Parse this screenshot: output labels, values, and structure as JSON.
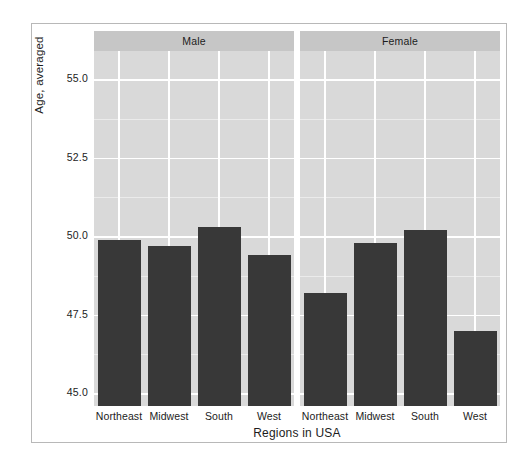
{
  "chart_data": {
    "type": "bar",
    "title": "",
    "xlabel": "Regions in USA",
    "ylabel": "Age, averaged",
    "categories": [
      "Northeast",
      "Midwest",
      "South",
      "West"
    ],
    "facet_variable": "Gender",
    "facets": [
      {
        "label": "Male",
        "values": [
          49.9,
          49.7,
          50.3,
          49.4
        ]
      },
      {
        "label": "Female",
        "values": [
          48.2,
          49.8,
          50.2,
          47.0
        ]
      }
    ],
    "ylim": [
      44.6,
      55.9
    ],
    "yticks": [
      "45.0",
      "47.5",
      "50.0",
      "52.5",
      "55.0"
    ],
    "ytick_values": [
      45.0,
      47.5,
      50.0,
      52.5,
      55.0
    ],
    "grid": true,
    "legend": "none",
    "bar_color": "#383838",
    "panel_background": "#d9d9d9",
    "strip_background": "#c6c6c6",
    "gridline_color": "#ffffff",
    "text_color": "#1c1c1c"
  },
  "axes": {
    "y_title": "Age, averaged",
    "x_title": "Regions in USA",
    "y_ticks": [
      {
        "label": "55.0",
        "value": 55.0
      },
      {
        "label": "52.5",
        "value": 52.5
      },
      {
        "label": "50.0",
        "value": 50.0
      },
      {
        "label": "47.5",
        "value": 47.5
      },
      {
        "label": "45.0",
        "value": 45.0
      }
    ]
  },
  "panels": [
    {
      "strip_label": "Male",
      "bars": [
        {
          "category": "Northeast",
          "value": 49.9
        },
        {
          "category": "Midwest",
          "value": 49.7
        },
        {
          "category": "South",
          "value": 50.3
        },
        {
          "category": "West",
          "value": 49.4
        }
      ]
    },
    {
      "strip_label": "Female",
      "bars": [
        {
          "category": "Northeast",
          "value": 48.2
        },
        {
          "category": "Midwest",
          "value": 49.8
        },
        {
          "category": "South",
          "value": 50.2
        },
        {
          "category": "West",
          "value": 47.0
        }
      ]
    }
  ]
}
